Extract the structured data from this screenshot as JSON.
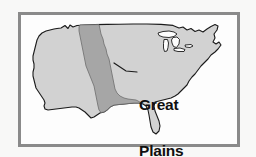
{
  "figure": {
    "kind": "thematic-map",
    "background_color": "#f8f8f7",
    "frame": {
      "border_color": "#8a8a8a",
      "fill_color": "#fdfdfd",
      "border_width_px": 3
    }
  },
  "map": {
    "outline_color": "#1a1a1a",
    "land_fill_color": "#d2d2d2",
    "highlight_fill_color": "#a6a6a6",
    "water_fill_color": "#fdfdfd",
    "features": {
      "land": "contiguous-united-states",
      "highlight_region": "great-plains-band",
      "lakes": "great-lakes",
      "peninsula": "florida"
    }
  },
  "annotation": {
    "label_line_1": "Great",
    "label_line_2": "Plains",
    "leader_line_color": "#1a1a1a",
    "text_color": "#101010"
  }
}
